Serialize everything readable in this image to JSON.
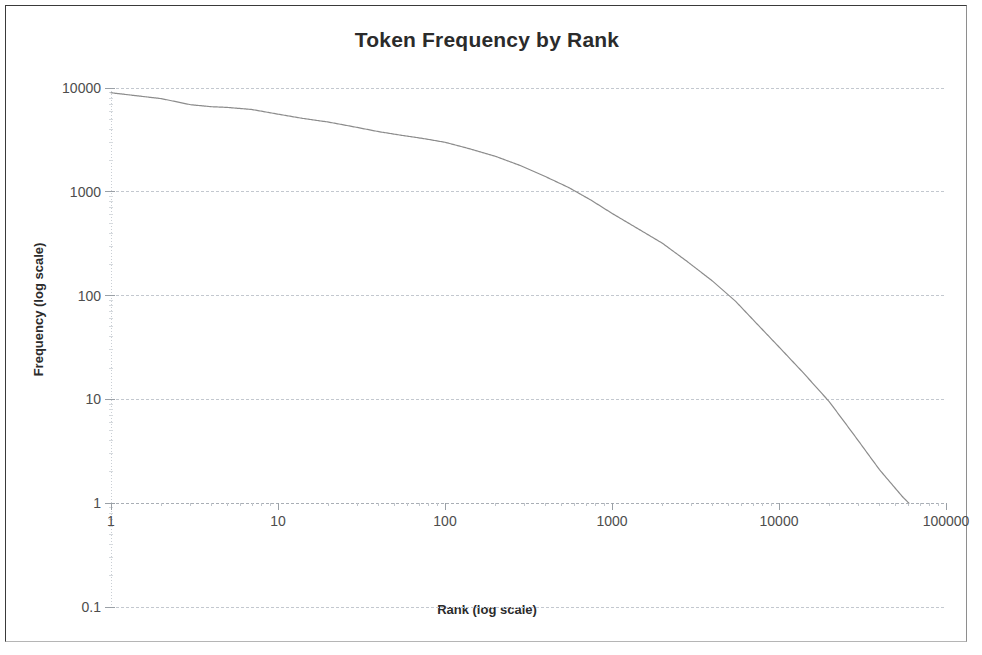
{
  "chart_data": {
    "type": "line",
    "title": "Token Frequency by Rank",
    "xlabel": "Rank (log scale)",
    "ylabel": "Frequency (log scale)",
    "xscale": "log",
    "yscale": "log",
    "xlim": [
      1,
      100000
    ],
    "ylim": [
      0.1,
      10000
    ],
    "grid": true,
    "legend": null,
    "xticks": [
      "1",
      "10",
      "100",
      "1000",
      "10000",
      "100000"
    ],
    "xtick_values": [
      1,
      10,
      100,
      1000,
      10000,
      100000
    ],
    "yticks": [
      "10000",
      "1000",
      "100",
      "10",
      "1",
      "0.1"
    ],
    "ytick_values": [
      10000,
      1000,
      100,
      10,
      1,
      0.1
    ],
    "series": [
      {
        "name": "Token frequency",
        "color": "#8c8c8c",
        "x": [
          1,
          2,
          3,
          4,
          5,
          7,
          10,
          14,
          20,
          28,
          40,
          55,
          75,
          100,
          140,
          200,
          280,
          400,
          550,
          750,
          1000,
          1400,
          2000,
          2800,
          4000,
          5500,
          7500,
          10000,
          14000,
          20000,
          28000,
          40000,
          55000,
          60000
        ],
        "y": [
          9000,
          7900,
          6900,
          6600,
          6500,
          6200,
          5600,
          5100,
          4700,
          4250,
          3800,
          3500,
          3250,
          3000,
          2600,
          2200,
          1800,
          1400,
          1100,
          830,
          620,
          450,
          320,
          215,
          138,
          88,
          52,
          32,
          18,
          9.5,
          4.6,
          2.1,
          1.15,
          1.0
        ]
      }
    ]
  },
  "axes": {
    "title": "Token Frequency by Rank",
    "x_title": "Rank (log scale)",
    "y_title": "Frequency (log scale)"
  },
  "colors": {
    "line": "#8c8c8c",
    "grid": "#c3c8cf",
    "axis": "#a9aeb5",
    "text": "#3c3c3c",
    "frame": "#3a3a3a"
  }
}
